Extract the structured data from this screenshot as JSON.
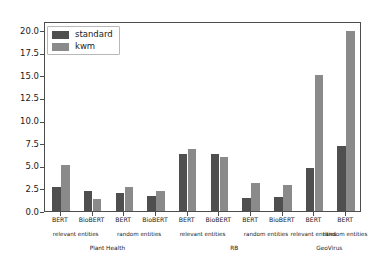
{
  "chart_data": {
    "type": "bar",
    "title": "",
    "xlabel": "",
    "ylabel": "",
    "ylim": [
      0,
      21.0
    ],
    "grid": false,
    "legend_position": "upper left",
    "yticks": [
      "0.0",
      "2.5",
      "5.0",
      "7.5",
      "10.0",
      "12.5",
      "15.0",
      "17.5",
      "20.0"
    ],
    "ytick_values": [
      0.0,
      2.5,
      5.0,
      7.5,
      10.0,
      12.5,
      15.0,
      17.5,
      20.0
    ],
    "categories": [
      "BERT",
      "BioBERT",
      "BERT",
      "BioBERT",
      "BERT",
      "BioBERT",
      "BERT",
      "BioBERT",
      "BERT",
      "BERT"
    ],
    "series": [
      {
        "name": "standard",
        "color": "#4f4f4f",
        "values": [
          2.7,
          2.25,
          1.95,
          1.7,
          6.3,
          6.3,
          1.45,
          1.5,
          4.8,
          7.2
        ]
      },
      {
        "name": "kwm",
        "color": "#8a8a8a",
        "values": [
          5.1,
          1.3,
          2.65,
          2.2,
          6.8,
          6.0,
          3.1,
          2.9,
          15.0,
          19.9
        ]
      }
    ],
    "entity_groups": [
      {
        "label": "relevant entities",
        "bars": [
          0,
          1
        ]
      },
      {
        "label": "random entities",
        "bars": [
          2,
          3
        ]
      },
      {
        "label": "relevant entities",
        "bars": [
          4,
          5
        ]
      },
      {
        "label": "random entities",
        "bars": [
          6,
          7
        ]
      },
      {
        "label": "relevant entities",
        "bars": [
          8
        ]
      },
      {
        "label": "random entities",
        "bars": [
          9
        ]
      }
    ],
    "datasets": [
      {
        "label": "Plant Health",
        "bars": [
          0,
          1,
          2,
          3
        ]
      },
      {
        "label": "RB",
        "bars": [
          4,
          5,
          6,
          7
        ]
      },
      {
        "label": "GeoVirus",
        "bars": [
          8,
          9
        ]
      }
    ]
  },
  "legend": {
    "entries": [
      {
        "label": "standard"
      },
      {
        "label": "kwm"
      }
    ]
  }
}
